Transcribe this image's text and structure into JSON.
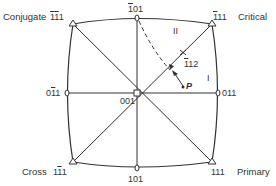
{
  "diagram": {
    "type": "stereographic-projection",
    "poles": {
      "top": {
        "parts": [
          {
            "t": "1",
            "bar": true
          },
          {
            "t": "0",
            "bar": false
          },
          {
            "t": "1",
            "bar": false
          }
        ]
      },
      "left": {
        "parts": [
          {
            "t": "0",
            "bar": false
          },
          {
            "t": "1",
            "bar": true
          },
          {
            "t": "1",
            "bar": false
          }
        ]
      },
      "right": {
        "parts": [
          {
            "t": "0",
            "bar": false
          },
          {
            "t": "1",
            "bar": false
          },
          {
            "t": "1",
            "bar": false
          }
        ]
      },
      "bottom": {
        "parts": [
          {
            "t": "1",
            "bar": false
          },
          {
            "t": "0",
            "bar": false
          },
          {
            "t": "1",
            "bar": false
          }
        ]
      },
      "center": {
        "parts": [
          {
            "t": "0",
            "bar": false
          },
          {
            "t": "0",
            "bar": false
          },
          {
            "t": "1",
            "bar": false
          }
        ]
      },
      "top_left": {
        "parts": [
          {
            "t": "1",
            "bar": true
          },
          {
            "t": "1",
            "bar": true
          },
          {
            "t": "1",
            "bar": false
          }
        ]
      },
      "top_right": {
        "parts": [
          {
            "t": "1",
            "bar": true
          },
          {
            "t": "1",
            "bar": false
          },
          {
            "t": "1",
            "bar": false
          }
        ]
      },
      "bottom_left": {
        "parts": [
          {
            "t": "1",
            "bar": false
          },
          {
            "t": "1",
            "bar": true
          },
          {
            "t": "1",
            "bar": false
          }
        ]
      },
      "bottom_right": {
        "parts": [
          {
            "t": "1",
            "bar": false
          },
          {
            "t": "1",
            "bar": false
          },
          {
            "t": "1",
            "bar": false
          }
        ]
      },
      "mid_112": {
        "parts": [
          {
            "t": "1",
            "bar": true
          },
          {
            "t": "1",
            "bar": false
          },
          {
            "t": "2",
            "bar": false
          }
        ]
      }
    },
    "slip_systems": {
      "top_left": "Conjugate",
      "top_right": "Critical",
      "bottom_left": "Cross",
      "bottom_right": "Primary"
    },
    "regions": {
      "one": "I",
      "two": "II"
    },
    "point_label": "P",
    "colors": {
      "line": "#333333"
    }
  }
}
